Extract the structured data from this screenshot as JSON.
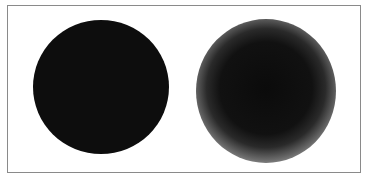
{
  "figure": {
    "frame": {
      "border_color": "#8a8a8a",
      "background": "#ffffff"
    },
    "shapes": [
      {
        "id": "sharp-disc",
        "kind": "circle",
        "edge": "sharp",
        "fill": "#0d0d0d",
        "center": [
          101,
          87
        ],
        "radius": 67
      },
      {
        "id": "blurred-disc",
        "kind": "circle",
        "edge": "blurred",
        "fill": "#0b0b0b",
        "center": [
          266,
          90
        ],
        "core_radius": 45,
        "outer_radius": 70
      }
    ]
  }
}
